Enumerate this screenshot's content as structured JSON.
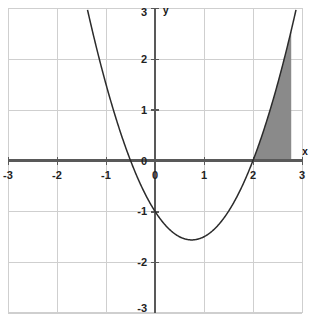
{
  "chart_data": {
    "type": "line",
    "title": "",
    "subtitle": "",
    "xlabel": "x",
    "ylabel": "y",
    "xlim": [
      -3,
      3
    ],
    "ylim": [
      -3,
      3
    ],
    "grid": true,
    "legend": "none",
    "x_ticks": [
      "-3",
      "-2",
      "-1",
      "0",
      "1",
      "2",
      "3"
    ],
    "x_tick_values": [
      -3,
      -2,
      -1,
      0,
      1,
      2,
      3
    ],
    "y_ticks": [
      "-3",
      "-2",
      "-1",
      "0",
      "1",
      "2",
      "3"
    ],
    "y_tick_values": [
      -3,
      -2,
      -1,
      0,
      1,
      2,
      3
    ],
    "series": [
      {
        "name": "parabola",
        "equation": "y = x^2 - 1.5x - 1",
        "color": "#2b2b2b",
        "a": 1,
        "b": -1.5,
        "c": -1,
        "roots": [
          -0.5,
          2
        ],
        "vertex": [
          0.75,
          -1.5625
        ],
        "y_intercept": -1,
        "x": [
          -1.25,
          -1.0,
          -0.75,
          -0.5,
          -0.25,
          0.0,
          0.25,
          0.5,
          0.75,
          1.0,
          1.25,
          1.5,
          1.75,
          2.0,
          2.25,
          2.5,
          2.75,
          2.92
        ],
        "values": [
          2.44,
          1.5,
          0.69,
          0.0,
          -0.56,
          -1.0,
          -1.31,
          -1.5,
          -1.56,
          -1.5,
          -1.31,
          -1.0,
          -0.56,
          0.0,
          0.69,
          1.5,
          2.44,
          3.0
        ]
      }
    ],
    "annotations": [
      {
        "name": "shaded-area",
        "label": "",
        "type": "area-under-curve",
        "x_start": 2.0,
        "x_end": 2.78,
        "bounded_below_by": "x-axis",
        "bounded_above_by": "curve",
        "fill": "#8a8a8a"
      }
    ],
    "colors": {
      "grid": "#cfcfcf",
      "axis": "#595959",
      "curve": "#2b2b2b",
      "shade": "#8a8a8a",
      "background": "#ffffff",
      "label": "#222222"
    }
  }
}
